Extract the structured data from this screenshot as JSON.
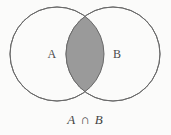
{
  "figure": {
    "background_color": "#fbfbfa",
    "width": 171,
    "height": 135,
    "caption": "A ∩ B"
  },
  "diagram": {
    "type": "venn",
    "stroke_color": "#6a6a6a",
    "stroke_width": 1,
    "circle_fill": "#fbfbfa",
    "intersection_fill": "#9a9a9a",
    "circles": [
      {
        "name": "A",
        "label": "A",
        "cx": 57,
        "cy": 54,
        "r": 47
      },
      {
        "name": "B",
        "label": "B",
        "cx": 113,
        "cy": 54,
        "r": 47
      }
    ],
    "region_labels": {
      "left": "A",
      "right": "B"
    },
    "shaded_region": "intersection"
  }
}
